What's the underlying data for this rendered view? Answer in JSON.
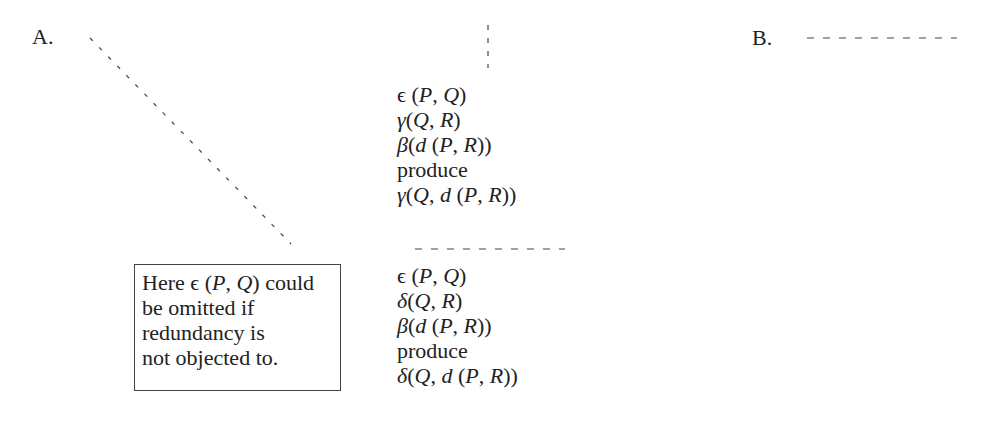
{
  "labels": {
    "a": "A.",
    "b": "B."
  },
  "upper_block": {
    "lines": [
      "ϵ (P, Q)",
      "γ(Q, R)",
      "β(d (P, R))",
      "produce",
      "γ(Q, d (P, R))"
    ]
  },
  "lower_block": {
    "lines": [
      "ϵ (P, Q)",
      "δ(Q, R)",
      "β(d (P, R))",
      "produce",
      "δ(Q, d (P, R))"
    ]
  },
  "note": {
    "lines": [
      "Here ϵ (P, Q) could",
      "be omitted if",
      "redundancy is",
      "not objected to."
    ]
  },
  "colors": {
    "text": "#222222",
    "dash": "#444444",
    "box_border": "#444444",
    "background": "#ffffff"
  }
}
